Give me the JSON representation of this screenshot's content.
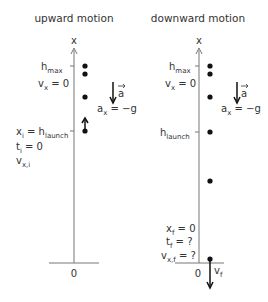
{
  "diagrams": [
    {
      "title": "upward motion",
      "axis_label": "x",
      "origin_label": "0",
      "labels": {
        "hmax_main": "h",
        "hmax_sub": "max",
        "vx_main": "v",
        "vx_sub": "x",
        "vx_rest": " = 0",
        "a_vec": "a",
        "ax_main": "a",
        "ax_sub": "x",
        "ax_rest": " = −g",
        "xi_main": "x",
        "xi_sub": "i",
        "xi_mid": " = h",
        "xi_sub2": "launch",
        "ti_main": "t",
        "ti_sub": "i",
        "ti_rest": " = 0",
        "vxi_main": "v",
        "vxi_sub": "x,i"
      }
    },
    {
      "title": "downward motion",
      "axis_label": "x",
      "origin_label": "0",
      "labels": {
        "hmax_main": "h",
        "hmax_sub": "max",
        "vx_main": "v",
        "vx_sub": "x",
        "vx_rest": " = 0",
        "a_vec": "a",
        "ax_main": "a",
        "ax_sub": "x",
        "ax_rest": " = −g",
        "hlaunch_main": "h",
        "hlaunch_sub": "launch",
        "xf_main": "x",
        "xf_sub": "f",
        "xf_rest": " = 0",
        "tf_main": "t",
        "tf_sub": "f",
        "tf_rest": " = ?",
        "vxf_main": "v",
        "vxf_sub": "x,f",
        "vxf_rest": " = ?",
        "vf_main": "v",
        "vf_sub": "f"
      }
    }
  ]
}
